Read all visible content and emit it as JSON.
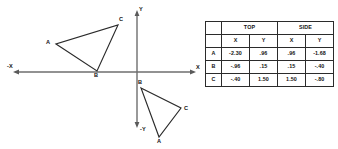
{
  "figure": {
    "axes": {
      "neg_x_label": "-X",
      "pos_x_label": "X",
      "pos_y_label": "Y",
      "neg_y_label": "-Y",
      "origin_px": [
        137,
        72
      ]
    },
    "triangles": [
      {
        "name": "top-view-triangle",
        "quadrant": "II",
        "vertices": [
          {
            "label": "A",
            "px": [
              56,
              44
            ]
          },
          {
            "label": "B",
            "px": [
              97,
              71
            ]
          },
          {
            "label": "C",
            "px": [
              118,
              25
            ]
          }
        ]
      },
      {
        "name": "side-view-triangle",
        "quadrant": "IV",
        "vertices": [
          {
            "label": "B",
            "px": [
              141,
              88
            ]
          },
          {
            "label": "C",
            "px": [
              181,
              108
            ]
          },
          {
            "label": "A",
            "px": [
              159,
              137
            ]
          }
        ]
      }
    ]
  },
  "table": {
    "group_headers": [
      "TOP",
      "SIDE"
    ],
    "sub_headers": [
      "X",
      "Y",
      "X",
      "Y"
    ],
    "rows": [
      {
        "label": "A",
        "values": [
          "-2.30",
          ".96",
          ".96",
          "-1.68"
        ]
      },
      {
        "label": "B",
        "values": [
          "-.96",
          ".15",
          ".15",
          "-.40"
        ]
      },
      {
        "label": "C",
        "values": [
          "-.40",
          "1.50",
          "1.50",
          "-.80"
        ]
      }
    ]
  },
  "colors": {
    "ink": "#1a1a1a",
    "axis": "#6e6e6e",
    "border": "#2b2b2b",
    "background": "#ffffff"
  }
}
